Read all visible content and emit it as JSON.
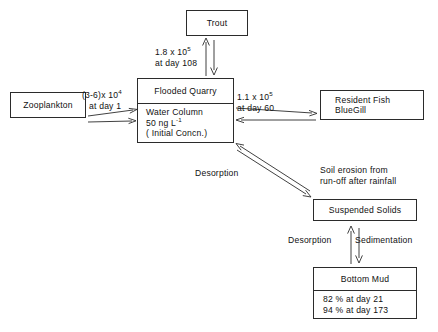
{
  "diagram": {
    "stroke_color": "#2b2b2b",
    "background_color": "#ffffff"
  },
  "boxes": {
    "trout": {
      "label": "Trout"
    },
    "quarry": {
      "header": "Flooded Quarry",
      "body_line1": "Water Column",
      "body_line2_value": "50 ng L",
      "body_line2_exponent": "-1",
      "body_line3": "( Initial Concn.)"
    },
    "zooplankton": {
      "label": "Zooplankton"
    },
    "resident_fish": {
      "line1": "Resident Fish",
      "line2": "BlueGill"
    },
    "suspended_solids": {
      "label": "Suspended Solids"
    },
    "bottom_mud": {
      "header": "Bottom Mud",
      "body_line1": "82 % at day 21",
      "body_line2": "94 % at day 173"
    }
  },
  "flux_labels": {
    "trout": {
      "value_prefix": "1.8 x 10",
      "value_exponent": "5",
      "day": "at day 108"
    },
    "zooplankton": {
      "value_prefix": "(3-6)x 10",
      "value_exponent": "4",
      "day": "at day 1"
    },
    "resident_fish": {
      "value_prefix": "1.1 x 10",
      "value_exponent": "5",
      "day": "at day 60"
    },
    "desorption_diagonal": "Desorption",
    "soil_erosion_line1": "Soil erosion from",
    "soil_erosion_line2": "run-off after rainfall",
    "desorption_vertical": "Desorption",
    "sedimentation_vertical": "Sedimentation"
  }
}
